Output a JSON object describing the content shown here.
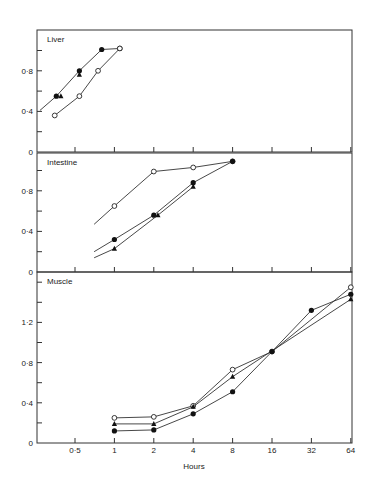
{
  "chart_data": {
    "type": "line",
    "xlabel": "Hours",
    "x_scale": "log2",
    "x_ticks": [
      0.5,
      1,
      2,
      4,
      8,
      16,
      32,
      64
    ],
    "x_tick_labels": [
      "0·5",
      "1",
      "2",
      "4",
      "8",
      "16",
      "32",
      "64"
    ],
    "markers": {
      "filled_circle": "●",
      "open_circle": "○",
      "filled_triangle": "▲"
    },
    "panels": [
      {
        "title": "Liver",
        "ylim": [
          0,
          1.2
        ],
        "y_ticks": [
          0,
          0.4,
          0.8
        ],
        "y_tick_labels": [
          "0",
          "0·4",
          "0·8"
        ],
        "series": [
          {
            "name": "filled-circle",
            "marker": "filled_circle",
            "points": [
              [
                0.36,
                0.55
              ],
              [
                0.54,
                0.8
              ],
              [
                0.8,
                1.01
              ],
              [
                1.1,
                1.02
              ]
            ]
          },
          {
            "name": "filled-triangle",
            "marker": "filled_triangle",
            "points": [
              [
                0.39,
                0.55
              ],
              [
                0.54,
                0.76
              ]
            ]
          },
          {
            "name": "open-circle",
            "marker": "open_circle",
            "points": [
              [
                0.35,
                0.36
              ],
              [
                0.54,
                0.55
              ],
              [
                0.75,
                0.8
              ],
              [
                1.1,
                1.02
              ]
            ]
          }
        ],
        "line_start": [
          0.27,
          0.41
        ]
      },
      {
        "title": "Intestine",
        "ylim": [
          0,
          1.2
        ],
        "y_ticks": [
          0,
          0.4,
          0.8
        ],
        "y_tick_labels": [
          "0",
          "0·4",
          "0·8"
        ],
        "series": [
          {
            "name": "open-circle",
            "marker": "open_circle",
            "points": [
              [
                1,
                0.65
              ],
              [
                2,
                0.99
              ],
              [
                4,
                1.03
              ],
              [
                8,
                1.09
              ]
            ],
            "line_start": [
              0.7,
              0.47
            ]
          },
          {
            "name": "filled-circle",
            "marker": "filled_circle",
            "points": [
              [
                1,
                0.32
              ],
              [
                2,
                0.56
              ],
              [
                4,
                0.88
              ],
              [
                8,
                1.09
              ]
            ],
            "line_start": [
              0.7,
              0.2
            ]
          },
          {
            "name": "filled-triangle",
            "marker": "filled_triangle",
            "points": [
              [
                1,
                0.23
              ],
              [
                2.15,
                0.56
              ],
              [
                4,
                0.84
              ]
            ],
            "line_start": [
              0.7,
              0.14
            ]
          }
        ]
      },
      {
        "title": "Muscle",
        "ylim": [
          0,
          1.7
        ],
        "y_ticks": [
          0,
          0.4,
          0.8,
          1.2
        ],
        "y_tick_labels": [
          "0",
          "0·4",
          "0·8",
          "1·2"
        ],
        "series": [
          {
            "name": "open-circle",
            "marker": "open_circle",
            "points": [
              [
                1,
                0.25
              ],
              [
                2,
                0.26
              ],
              [
                4,
                0.37
              ],
              [
                8,
                0.73
              ],
              [
                16,
                0.91
              ],
              [
                64,
                1.55
              ]
            ]
          },
          {
            "name": "filled-triangle",
            "marker": "filled_triangle",
            "points": [
              [
                1,
                0.19
              ],
              [
                2,
                0.19
              ],
              [
                4,
                0.36
              ],
              [
                8,
                0.66
              ],
              [
                64,
                1.43
              ]
            ]
          },
          {
            "name": "filled-circle",
            "marker": "filled_circle",
            "points": [
              [
                1,
                0.12
              ],
              [
                2,
                0.13
              ],
              [
                4,
                0.29
              ],
              [
                8,
                0.51
              ],
              [
                16,
                0.91
              ],
              [
                32,
                1.32
              ],
              [
                64,
                1.48
              ]
            ]
          }
        ]
      }
    ]
  }
}
